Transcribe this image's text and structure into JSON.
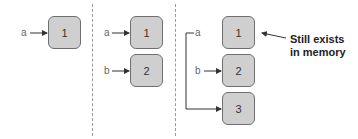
{
  "panels": [
    {
      "variables": [
        {
          "name": "a",
          "points_to": "1"
        }
      ],
      "boxes": [
        "1"
      ]
    },
    {
      "variables": [
        {
          "name": "a",
          "points_to": "1"
        },
        {
          "name": "b",
          "points_to": "2"
        }
      ],
      "boxes": [
        "1",
        "2"
      ]
    },
    {
      "variables": [
        {
          "name": "a",
          "points_to": "3"
        },
        {
          "name": "b",
          "points_to": "2"
        }
      ],
      "boxes": [
        "1",
        "2",
        "3"
      ],
      "annotation": {
        "line1": "Still exists",
        "line2": "in memory",
        "target": "1"
      }
    }
  ],
  "colors": {
    "box_fill": "#cfcfcf",
    "box_border": "#6f6f6f",
    "arrow": "#333333"
  }
}
